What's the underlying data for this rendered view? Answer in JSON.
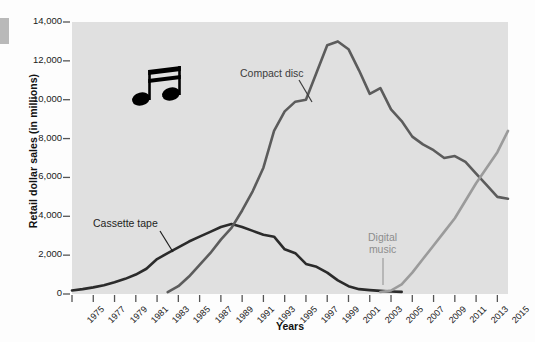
{
  "chart_data": {
    "type": "line",
    "title": "",
    "xlabel": "Years",
    "ylabel": "Retail dollar sales (in millions)",
    "xlim": [
      1975,
      2016
    ],
    "ylim": [
      0,
      14000
    ],
    "grid": false,
    "legend_position": "inline-annotations",
    "ytick_labels": [
      "14,000",
      "12,000",
      "10,000",
      "8,000",
      "6,000",
      "4,000",
      "2,000",
      "0"
    ],
    "ytick_values": [
      14000,
      12000,
      10000,
      8000,
      6000,
      4000,
      2000,
      0
    ],
    "xtick_labels": [
      "1975",
      "1977",
      "1979",
      "1981",
      "1983",
      "1985",
      "1987",
      "1989",
      "1991",
      "1993",
      "1995",
      "1997",
      "1999",
      "2001",
      "2003",
      "2005",
      "2007",
      "2009",
      "2011",
      "2013",
      "2015"
    ],
    "xtick_values": [
      1975,
      1977,
      1979,
      1981,
      1983,
      1985,
      1987,
      1989,
      1991,
      1993,
      1995,
      1997,
      1999,
      2001,
      2003,
      2005,
      2007,
      2009,
      2011,
      2013,
      2015
    ],
    "series": [
      {
        "name": "Cassette tape",
        "color": "#2b2b2b",
        "x": [
          1975,
          1976,
          1977,
          1978,
          1979,
          1980,
          1981,
          1982,
          1983,
          1984,
          1985,
          1986,
          1987,
          1988,
          1989,
          1990,
          1991,
          1992,
          1993,
          1994,
          1995,
          1996,
          1997,
          1998,
          1999,
          2000,
          2001,
          2002,
          2003,
          2004,
          2005,
          2006
        ],
        "values": [
          180,
          250,
          340,
          450,
          600,
          780,
          1000,
          1300,
          1800,
          2100,
          2400,
          2700,
          2950,
          3200,
          3450,
          3600,
          3450,
          3250,
          3050,
          2950,
          2300,
          2100,
          1550,
          1400,
          1100,
          700,
          400,
          250,
          200,
          160,
          130,
          110
        ]
      },
      {
        "name": "Compact disc",
        "color": "#5c5c5c",
        "x": [
          1984,
          1985,
          1986,
          1987,
          1988,
          1989,
          1990,
          1991,
          1992,
          1993,
          1994,
          1995,
          1996,
          1997,
          1998,
          1999,
          2000,
          2001,
          2002,
          2003,
          2004,
          2005,
          2006,
          2007,
          2008,
          2009,
          2010,
          2011,
          2012,
          2013,
          2014,
          2015,
          2016
        ],
        "values": [
          100,
          400,
          900,
          1500,
          2100,
          2800,
          3400,
          4300,
          5300,
          6500,
          8400,
          9400,
          9900,
          10000,
          11400,
          12800,
          13000,
          12600,
          11500,
          10300,
          10600,
          9500,
          8900,
          8100,
          7700,
          7400,
          7000,
          7100,
          6800,
          6200,
          5600,
          5000,
          4900
        ]
      },
      {
        "name": "Digital music",
        "color": "#9b9b9b",
        "x": [
          2004,
          2005,
          2006,
          2007,
          2008,
          2009,
          2010,
          2011,
          2012,
          2013,
          2014,
          2015,
          2016
        ],
        "values": [
          100,
          180,
          500,
          1100,
          1800,
          2500,
          3200,
          3900,
          4800,
          5700,
          6500,
          7300,
          8400
        ]
      }
    ],
    "annotations": [
      {
        "name": "compact-disc-label",
        "text": "Compact disc",
        "color": "#3c3c3c"
      },
      {
        "name": "cassette-tape-label",
        "text": "Cassette tape",
        "color": "#1e1e1e"
      },
      {
        "name": "digital-music-label",
        "text_line1": "Digital",
        "text_line2": "music",
        "color": "#8d8d8d"
      }
    ],
    "decorations": [
      {
        "name": "music-note-icon",
        "description": "beamed sixteenth notes"
      }
    ]
  }
}
